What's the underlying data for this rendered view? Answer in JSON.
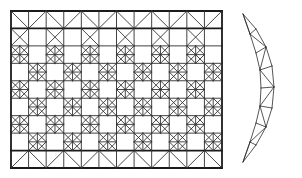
{
  "figure": {
    "background_color": "#ffffff",
    "line_color": "#2b2b2b",
    "thick_line_color": "#1a1a1a",
    "width": 302,
    "height": 178
  },
  "rect_mesh": {
    "name": "rectangular-triangulated-mesh",
    "x0": 11,
    "y0": 11,
    "x1": 222,
    "y1": 168,
    "columns": 12,
    "rows": 9,
    "cell_width": 17.58,
    "cell_height": 17.44,
    "x_gridlines": [
      11,
      28.58,
      46.17,
      63.75,
      81.33,
      98.92,
      116.5,
      134.08,
      151.67,
      169.25,
      186.83,
      204.42,
      222
    ],
    "y_gridlines": [
      11,
      28.44,
      45.89,
      63.33,
      80.78,
      98.22,
      115.67,
      133.11,
      150.56,
      168
    ],
    "emphasized_rows": [
      1,
      8
    ],
    "pattern_note": "alternating checkerboard of crossed (X plus star) cells and plain cells; top and bottom bands are zigzag truss rows"
  },
  "crescent_mesh": {
    "name": "crescent-strip-mesh",
    "outer_curve": [
      [
        243,
        14
      ],
      [
        256,
        29
      ],
      [
        266,
        47
      ],
      [
        272,
        66
      ],
      [
        274,
        87
      ],
      [
        272,
        108
      ],
      [
        266,
        127
      ],
      [
        256,
        145
      ],
      [
        243,
        162
      ]
    ],
    "inner_curve": [
      [
        243,
        14
      ],
      [
        250,
        34
      ],
      [
        256,
        53
      ],
      [
        260,
        70
      ],
      [
        261,
        88
      ],
      [
        260,
        106
      ],
      [
        256,
        123
      ],
      [
        250,
        142
      ],
      [
        243,
        162
      ]
    ],
    "node_count": 18,
    "segments": 8
  },
  "labels": {
    "left_figure": "",
    "right_figure": ""
  }
}
